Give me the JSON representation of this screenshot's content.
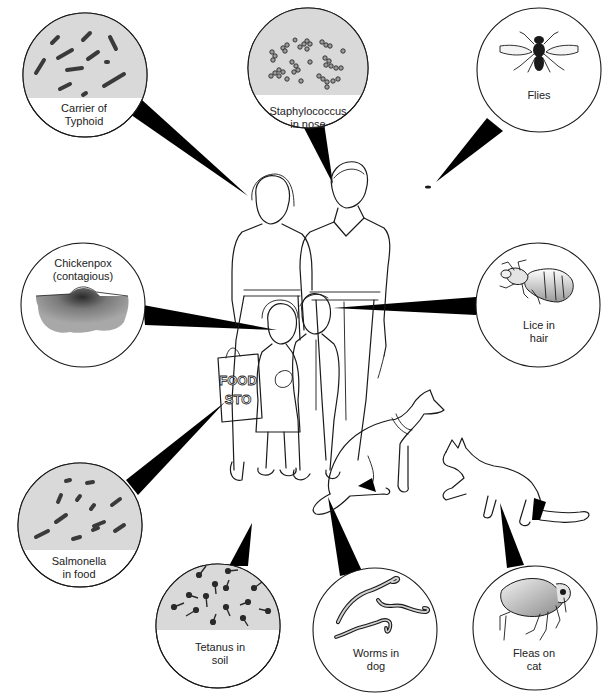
{
  "figure": {
    "colors": {
      "ink": "#1a1a1a",
      "lens_shade": "#d9d9d9",
      "background": "#ffffff",
      "chickenpox_skin": "#9a9a9a"
    }
  },
  "callouts": [
    {
      "id": "typhoid",
      "line1": "Carrier of",
      "line2": "Typhoid",
      "target": "mother",
      "image": "rod-bacteria"
    },
    {
      "id": "staphylococcus",
      "line1": "Staphylococcus",
      "line2": "in nose",
      "target": "father-nose",
      "image": "cocci-clusters"
    },
    {
      "id": "flies",
      "line1": "Flies",
      "line2": "",
      "target": "fly-speck",
      "image": "housefly"
    },
    {
      "id": "chickenpox",
      "line1": "Chickenpox",
      "line2": "(contagious)",
      "target": "girl-face",
      "image": "skin-blister"
    },
    {
      "id": "lice",
      "line1": "Lice in",
      "line2": "hair",
      "target": "boy-hair",
      "image": "louse"
    },
    {
      "id": "salmonella",
      "line1": "Salmonella",
      "line2": "in food",
      "target": "food-store-bag",
      "image": "rod-bacteria"
    },
    {
      "id": "tetanus",
      "line1": "Tetanus in",
      "line2": "soil",
      "target": "ground",
      "image": "drumstick-bacteria"
    },
    {
      "id": "worms",
      "line1": "Worms in",
      "line2": "dog",
      "target": "dog",
      "image": "roundworms"
    },
    {
      "id": "fleas",
      "line1": "Fleas on",
      "line2": "cat",
      "target": "cat",
      "image": "flea"
    }
  ],
  "scene": {
    "bag_text_line1": "FOOD",
    "bag_text_line2": "STO",
    "people": [
      "mother",
      "father",
      "girl",
      "boy"
    ],
    "animals": [
      "dog",
      "cat"
    ]
  }
}
